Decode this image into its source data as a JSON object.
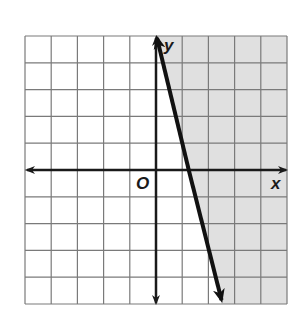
{
  "chart_data": {
    "type": "line",
    "title": "",
    "xlabel": "x",
    "ylabel": "y",
    "origin_label": "O",
    "xlim": [
      -5,
      5
    ],
    "ylim": [
      -5,
      5
    ],
    "grid": true,
    "grid_step": 1,
    "series": [
      {
        "name": "boundary line",
        "equation": "y = -4x + 5",
        "style": "solid",
        "x": [
          0,
          2.5
        ],
        "y": [
          5,
          -5
        ]
      }
    ],
    "shaded_region": "right of line (y > -4x + 5)",
    "colors": {
      "shade": "#e0e0e0",
      "grid": "#7a7a7a",
      "axis": "#1a1a1a",
      "line": "#111111"
    }
  },
  "labels": {
    "x_axis": "x",
    "y_axis": "y",
    "origin": "O"
  }
}
